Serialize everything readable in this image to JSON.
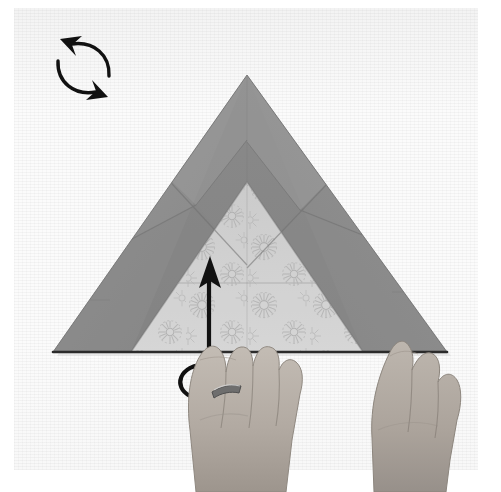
{
  "figure": {
    "kind": "origami-instruction-photograph",
    "title": "Origami folding step photograph",
    "width": 501,
    "height": 492,
    "background_color": "#ffffff",
    "photo": {
      "left": 14,
      "top": 8,
      "width": 464,
      "height": 462,
      "paper_color": "#fbfbfb"
    }
  },
  "model": {
    "name": "folded-paper-triangle",
    "description": "Large gray triangular folded paper with patterned underside showing at the lower centre",
    "apex": [
      247,
      75
    ],
    "bottom_left": [
      53,
      352
    ],
    "bottom_right": [
      447,
      352
    ],
    "outer_flap_color": "#8d8d8d",
    "outer_flap_color_light": "#9c9c9c",
    "outer_flap_color_dark": "#7e7e7e",
    "inner_panel_color": "#cbcbcb",
    "bottom_edge_color": "#2b2b2b",
    "pattern_name": "chrysanthemum-rosette-print",
    "pattern_color": "#a9a9a9"
  },
  "annotations": {
    "rotate_symbol": {
      "name": "turn-over-rotate-symbol",
      "meaning": "rotate / turn the model over",
      "position": [
        38,
        24
      ],
      "color": "#111111",
      "arrow_count": 2
    },
    "fold_arrow": {
      "name": "fold-up-arrow",
      "meaning": "fold the near flap upward",
      "direction": "up",
      "tail_style": "hooked-curl",
      "tip": [
        210,
        258
      ],
      "base": [
        205,
        398
      ],
      "color": "#111111"
    }
  },
  "hands": [
    {
      "name": "left-hand",
      "side": "left",
      "wearing_ring": true,
      "ring_color": "#6f6f6f",
      "skin_color": "#b6aea6",
      "position": [
        196,
        346
      ]
    },
    {
      "name": "right-hand",
      "side": "right",
      "wearing_ring": false,
      "skin_color": "#b6aea6",
      "position": [
        388,
        338
      ]
    }
  ]
}
